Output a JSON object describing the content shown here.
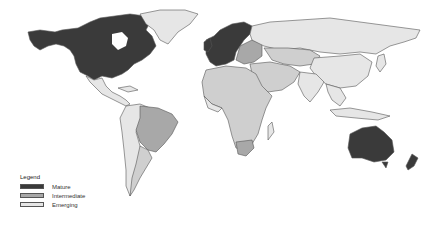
{
  "map": {
    "type": "choropleth world map",
    "legend": {
      "title": "Legend",
      "items": [
        {
          "label": "Mature",
          "color": "#3a3a3a"
        },
        {
          "label": "Intermediate",
          "color": "#a8a8a8"
        },
        {
          "label": "Emerging",
          "color": "#e6e6e6"
        }
      ]
    },
    "colors": {
      "background": "#ffffff",
      "border": "#555555",
      "mature": "#3a3a3a",
      "intermediate": "#a8a8a8",
      "emerging": "#e6e6e6",
      "other": "#cfcfcf"
    },
    "regions": {
      "mature": [
        "United States",
        "Canada",
        "Western Europe",
        "Scandinavia",
        "Australia",
        "New Zealand"
      ],
      "intermediate": [
        "Brazil",
        "South Africa",
        "Eastern Europe",
        "Mexico",
        "Argentina"
      ],
      "emerging": [
        "Greenland",
        "Russia",
        "China",
        "India",
        "Africa (most)",
        "Middle East",
        "Central America",
        "South America (rest)",
        "Southeast Asia"
      ]
    }
  }
}
